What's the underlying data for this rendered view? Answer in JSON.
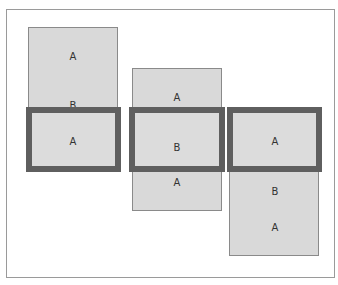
{
  "diagram": {
    "columns": [
      {
        "strip_labels": [
          "A",
          "B"
        ],
        "window_label": "A"
      },
      {
        "strip_labels": [
          "A",
          "A"
        ],
        "window_label": "B"
      },
      {
        "strip_labels": [
          "B",
          "A"
        ],
        "window_label": "A"
      }
    ],
    "colors": {
      "strip_fill": "#d9d9d9",
      "window_border": "#5f5f5f",
      "frame_border": "#9a9a9a"
    }
  }
}
